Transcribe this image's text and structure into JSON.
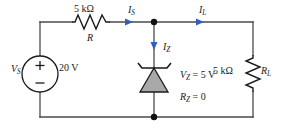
{
  "figure": {
    "kind": "zener-shunt-regulator-circuit",
    "colors": {
      "wire": "#4a4a4a",
      "node": "#111111",
      "current_arrow": "#2f5fc4",
      "diode_fill": "#a9a9a9",
      "diode_stroke": "#1a1a1a",
      "text": "#1a1a1a",
      "background": "#ffffff"
    }
  },
  "source": {
    "name": "V",
    "name_sub": "S",
    "value": "20 V",
    "plus_sign": "+",
    "minus_sign": "−"
  },
  "series_resistor": {
    "value": "5 kΩ",
    "name": "R"
  },
  "load_resistor": {
    "value": "5 kΩ",
    "name": "R",
    "name_sub": "L"
  },
  "zener": {
    "voltage_label": "V",
    "voltage_sub": "Z",
    "voltage_eq": " = 5 V",
    "resistance_label": "R",
    "resistance_sub": "Z",
    "resistance_eq": " = 0"
  },
  "currents": [
    {
      "name": "I",
      "sub": "S",
      "direction": "right"
    },
    {
      "name": "I",
      "sub": "Z",
      "direction": "down"
    },
    {
      "name": "I",
      "sub": "L",
      "direction": "right"
    }
  ]
}
